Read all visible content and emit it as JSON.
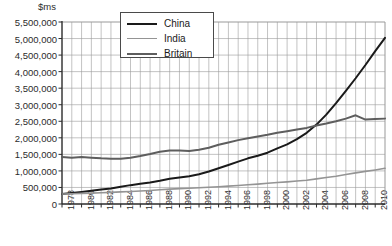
{
  "chart_data": {
    "type": "line",
    "title": "",
    "subtitle": "",
    "ylabel": "$ms",
    "xlabel": "",
    "ylim": [
      0,
      5500000
    ],
    "xlim": [
      1978,
      2011
    ],
    "grid": true,
    "grid_x_step": 1,
    "grid_y_step": 500000,
    "legend_position": "top-center",
    "ytick_labels": [
      "5,500,000",
      "5,000,000",
      "4,500,000",
      "4,000,000",
      "3,500,000",
      "3,000,000",
      "2,500,000",
      "2,000,000",
      "1,500,000",
      "1,000,000",
      "500,000",
      "0"
    ],
    "ytick_values": [
      5500000,
      5000000,
      4500000,
      4000000,
      3500000,
      3000000,
      2500000,
      2000000,
      1500000,
      1000000,
      500000,
      0
    ],
    "xtick_labels": [
      "1978",
      "1980",
      "1982",
      "1984",
      "1986",
      "1988",
      "1990",
      "1992",
      "1994",
      "1996",
      "1998",
      "2000",
      "2002",
      "2004",
      "2006",
      "2008",
      "2010"
    ],
    "xtick_values": [
      1978,
      1980,
      1982,
      1984,
      1986,
      1988,
      1990,
      1992,
      1994,
      1996,
      1998,
      2000,
      2002,
      2004,
      2006,
      2008,
      2010
    ],
    "x": [
      1978,
      1979,
      1980,
      1981,
      1982,
      1983,
      1984,
      1985,
      1986,
      1987,
      1988,
      1989,
      1990,
      1991,
      1992,
      1993,
      1994,
      1995,
      1996,
      1997,
      1998,
      1999,
      2000,
      2001,
      2002,
      2003,
      2004,
      2005,
      2006,
      2007,
      2008,
      2009,
      2010,
      2011
    ],
    "series": [
      {
        "name": "China",
        "color": "#1a1a1a",
        "width": 2.0,
        "values": [
          300000,
          330000,
          365000,
          400000,
          435000,
          470000,
          520000,
          570000,
          610000,
          650000,
          700000,
          760000,
          800000,
          840000,
          900000,
          980000,
          1080000,
          1180000,
          1280000,
          1380000,
          1460000,
          1550000,
          1680000,
          1800000,
          1960000,
          2150000,
          2400000,
          2700000,
          3050000,
          3420000,
          3800000,
          4200000,
          4620000,
          5020000
        ]
      },
      {
        "name": "India",
        "color": "#949494",
        "width": 1.6,
        "values": [
          300000,
          310000,
          320000,
          330000,
          340000,
          350000,
          365000,
          380000,
          395000,
          410000,
          430000,
          450000,
          465000,
          475000,
          490000,
          505000,
          520000,
          540000,
          560000,
          580000,
          600000,
          625000,
          650000,
          670000,
          695000,
          720000,
          760000,
          800000,
          840000,
          890000,
          940000,
          985000,
          1030000,
          1080000
        ]
      },
      {
        "name": "Britain",
        "color": "#5e5e5e",
        "width": 2.0,
        "values": [
          1420000,
          1400000,
          1420000,
          1400000,
          1380000,
          1370000,
          1370000,
          1400000,
          1450000,
          1510000,
          1580000,
          1620000,
          1620000,
          1600000,
          1640000,
          1700000,
          1790000,
          1860000,
          1930000,
          1990000,
          2040000,
          2090000,
          2150000,
          2200000,
          2250000,
          2300000,
          2370000,
          2430000,
          2500000,
          2580000,
          2680000,
          2550000,
          2570000,
          2580000
        ]
      }
    ]
  },
  "legend": {
    "items": [
      {
        "label": "China",
        "color": "#1a1a1a",
        "width": "2px"
      },
      {
        "label": "India",
        "color": "#949494",
        "width": "1.6px"
      },
      {
        "label": "Britain",
        "color": "#5e5e5e",
        "width": "2px"
      }
    ]
  },
  "axis": {
    "unit_label": "$ms"
  },
  "colors": {
    "grid": "#9a9a9a",
    "axis": "#2b2b2b",
    "background": "#ffffff"
  }
}
